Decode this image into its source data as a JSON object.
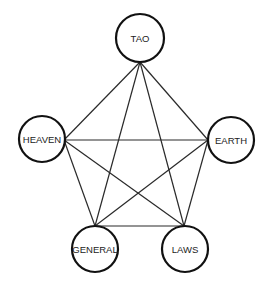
{
  "diagram": {
    "type": "complete-graph",
    "colors": {
      "background": "#ffffff",
      "edge": "#2a2a2a",
      "node_stroke": "#111111",
      "node_fill": "#ffffff",
      "label": "#222222"
    },
    "nodes": [
      {
        "id": "tao",
        "label": "TAO",
        "cx": 140,
        "cy": 38,
        "r": 24,
        "anchor": [
          140,
          62
        ]
      },
      {
        "id": "heaven",
        "label": "HEAVEN",
        "cx": 42,
        "cy": 139,
        "r": 23,
        "anchor": [
          64,
          140
        ]
      },
      {
        "id": "earth",
        "label": "EARTH",
        "cx": 231,
        "cy": 140,
        "r": 23,
        "anchor": [
          208,
          140
        ]
      },
      {
        "id": "general",
        "label": "GENERAL",
        "cx": 95,
        "cy": 249,
        "r": 23,
        "anchor": [
          95,
          226
        ]
      },
      {
        "id": "laws",
        "label": "LAWS",
        "cx": 185,
        "cy": 249,
        "r": 23,
        "anchor": [
          184,
          226
        ]
      }
    ],
    "edges": [
      [
        "tao",
        "heaven"
      ],
      [
        "tao",
        "earth"
      ],
      [
        "tao",
        "general"
      ],
      [
        "tao",
        "laws"
      ],
      [
        "heaven",
        "earth"
      ],
      [
        "heaven",
        "general"
      ],
      [
        "heaven",
        "laws"
      ],
      [
        "earth",
        "general"
      ],
      [
        "earth",
        "laws"
      ],
      [
        "general",
        "laws"
      ]
    ]
  }
}
